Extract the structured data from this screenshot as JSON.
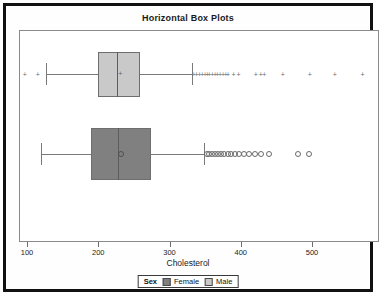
{
  "chart_data": {
    "type": "box",
    "title": "Horizontal Box Plots",
    "xlabel": "Cholesterol",
    "ylabel": "",
    "orientation": "horizontal",
    "xlim": [
      93,
      598
    ],
    "xticks": [
      100,
      200,
      300,
      400,
      500
    ],
    "xticklabels": [
      "100",
      "200",
      "300",
      "400",
      "500"
    ],
    "grid": false,
    "legend": {
      "title": "Sex",
      "position": "bottom",
      "entries": [
        {
          "label": "Female",
          "color": "#808080"
        },
        {
          "label": "Male",
          "color": "#c9c9c9"
        }
      ]
    },
    "boxes": [
      {
        "group": "Male",
        "color": "#c9c9c9",
        "marker": "plus",
        "whisker_low": 126,
        "q1": 200,
        "median": 226,
        "mean": 231,
        "q3": 259,
        "whisker_high": 331,
        "outliers_low": [
          97,
          115
        ],
        "outliers_high": [
          334,
          338,
          342,
          346,
          350,
          353,
          356,
          360,
          364,
          367,
          371,
          375,
          379,
          382,
          390,
          397,
          421,
          428,
          433,
          459,
          497,
          532,
          571
        ]
      },
      {
        "group": "Female",
        "color": "#808080",
        "marker": "circle",
        "whisker_low": 119,
        "q1": 190,
        "median": 228,
        "mean": 232,
        "q3": 274,
        "whisker_high": 349,
        "outliers_low": [],
        "outliers_high": [
          352,
          356,
          360,
          364,
          368,
          372,
          377,
          382,
          387,
          392,
          397,
          404,
          412,
          420,
          429,
          440,
          481,
          496
        ]
      }
    ]
  }
}
